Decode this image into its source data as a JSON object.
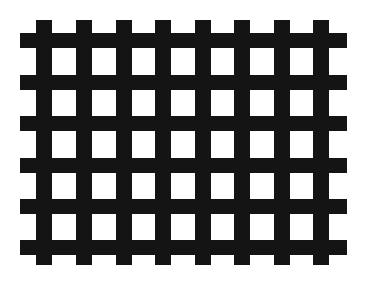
{
  "figure": {
    "colors": {
      "bar": "#141414",
      "background": "#ffffff"
    },
    "horizontal_bars": {
      "count": 6,
      "left": 20,
      "right": 347,
      "thickness": 15,
      "tops": [
        33,
        75,
        116,
        158,
        199,
        240
      ]
    },
    "vertical_bars": {
      "count": 8,
      "top": 20,
      "bottom": 265,
      "thickness": 16,
      "lefts": [
        36,
        76,
        116,
        155,
        195,
        234,
        274,
        313
      ]
    }
  }
}
